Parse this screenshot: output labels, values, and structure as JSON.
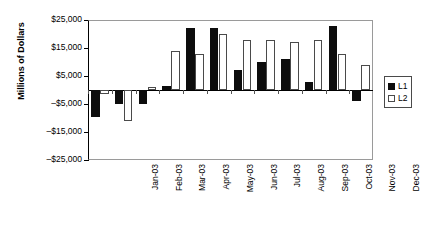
{
  "chart_data": {
    "type": "bar",
    "title": "",
    "xlabel": "",
    "ylabel": "Millions of Dollars",
    "ylim": [
      -25000,
      25000
    ],
    "ytick_values": [
      25000,
      15000,
      5000,
      -5000,
      -15000,
      -25000
    ],
    "ytick_labels": [
      "$25,000",
      "$15,000",
      "$5,000",
      "–$5,000",
      "–$15,000",
      "–$25,000"
    ],
    "grid": false,
    "legend_position": "right",
    "categories": [
      "Jan-03",
      "Feb-03",
      "Mar-03",
      "Apr-03",
      "May-03",
      "Jun-03",
      "Jul-03",
      "Aug-03",
      "Sep-03",
      "Oct-03",
      "Nov-03",
      "Dec-03"
    ],
    "series": [
      {
        "name": "L1",
        "color": "#0d0d0d",
        "values": [
          -9500,
          -5000,
          -5000,
          1500,
          22000,
          22000,
          7000,
          10000,
          11000,
          3000,
          23000,
          -4000
        ]
      },
      {
        "name": "L2",
        "color": "#ffffff",
        "values": [
          -1500,
          -11000,
          1000,
          14000,
          13000,
          20000,
          18000,
          18000,
          17000,
          18000,
          13000,
          9000
        ]
      }
    ]
  },
  "legend": {
    "items": [
      {
        "label": "L1",
        "swatch": "filled-black-square"
      },
      {
        "label": "L2",
        "swatch": "outlined-white-square"
      }
    ]
  }
}
